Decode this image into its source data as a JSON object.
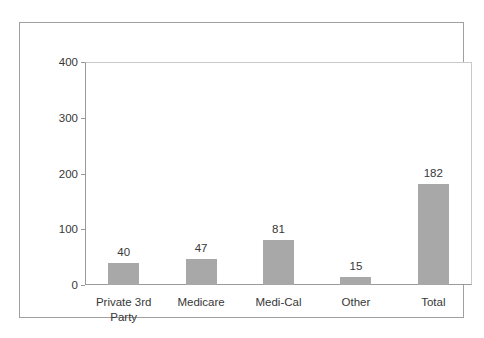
{
  "chart_data": {
    "type": "bar",
    "categories": [
      "Private 3rd Party",
      "Medicare",
      "Medi-Cal",
      "Other",
      "Total"
    ],
    "values": [
      40,
      47,
      81,
      15,
      182
    ],
    "data_labels": [
      "40",
      "47",
      "81",
      "15",
      "182"
    ],
    "title": "",
    "xlabel": "",
    "ylabel": "",
    "ylim": [
      0,
      400
    ],
    "yticks": [
      0,
      100,
      200,
      300,
      400
    ],
    "grid": false,
    "legend_position": "none",
    "bar_color": "#a8a8a8",
    "axis_color": "#9a9a9a",
    "plot_border_color": "#c9c9c9",
    "outer_border_color": "#a0a0a0",
    "text_color": "#373737",
    "background_color": "#ffffff"
  }
}
